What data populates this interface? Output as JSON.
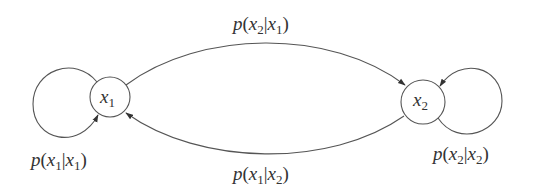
{
  "diagram": {
    "type": "markov-chain-state-transition",
    "stroke_color": "#555555",
    "text_color": "#333333",
    "background": "#ffffff",
    "nodes": [
      {
        "id": "x1",
        "var": "x",
        "sub": "1",
        "cx": 110,
        "cy": 97,
        "r": 20
      },
      {
        "id": "x2",
        "var": "x",
        "sub": "2",
        "cx": 423,
        "cy": 102,
        "r": 22
      }
    ],
    "edges": [
      {
        "id": "x1-to-x2",
        "from": "x1",
        "to": "x2",
        "label": {
          "p": "p",
          "a_var": "x",
          "a_sub": "2",
          "b_var": "x",
          "b_sub": "1"
        },
        "label_text": "p(x2|x1)"
      },
      {
        "id": "x2-to-x1",
        "from": "x2",
        "to": "x1",
        "label": {
          "p": "p",
          "a_var": "x",
          "a_sub": "1",
          "b_var": "x",
          "b_sub": "2"
        },
        "label_text": "p(x1|x2)"
      },
      {
        "id": "x1-self",
        "from": "x1",
        "to": "x1",
        "label": {
          "p": "p",
          "a_var": "x",
          "a_sub": "1",
          "b_var": "x",
          "b_sub": "1"
        },
        "label_text": "p(x1|x1)"
      },
      {
        "id": "x2-self",
        "from": "x2",
        "to": "x2",
        "label": {
          "p": "p",
          "a_var": "x",
          "a_sub": "2",
          "b_var": "x",
          "b_sub": "2"
        },
        "label_text": "p(x2|x2)"
      }
    ]
  }
}
